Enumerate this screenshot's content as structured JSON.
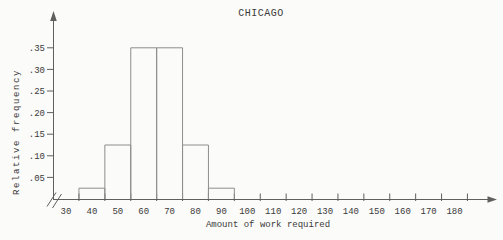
{
  "colors": {
    "background": "#fbfbf9",
    "axis": "#5f5f5f",
    "bar_outline": "#8d8d8d",
    "text": "#3a3a3a"
  },
  "chart_data": {
    "type": "bar",
    "title": "CHICAGO",
    "xlabel": "Amount of work required",
    "ylabel": "Relative frequency",
    "bars": [
      {
        "from": 35,
        "to": 45,
        "rel_freq": 0.025
      },
      {
        "from": 45,
        "to": 55,
        "rel_freq": 0.125
      },
      {
        "from": 55,
        "to": 65,
        "rel_freq": 0.35
      },
      {
        "from": 65,
        "to": 75,
        "rel_freq": 0.35
      },
      {
        "from": 75,
        "to": 85,
        "rel_freq": 0.125
      },
      {
        "from": 85,
        "to": 95,
        "rel_freq": 0.025
      }
    ],
    "x_tick_labels": [
      30,
      40,
      50,
      60,
      70,
      80,
      90,
      100,
      110,
      120,
      130,
      140,
      150,
      160,
      170,
      180
    ],
    "x_boundary_ticks": [
      35,
      45,
      55,
      65,
      75,
      85,
      95,
      105,
      115,
      125,
      135,
      145,
      155,
      165,
      175,
      185
    ],
    "y_ticks": [
      {
        "value": 0.05,
        "label": ".05"
      },
      {
        "value": 0.1,
        "label": ".10"
      },
      {
        "value": 0.15,
        "label": ".15"
      },
      {
        "value": 0.2,
        "label": ".20"
      },
      {
        "value": 0.25,
        "label": ".25"
      },
      {
        "value": 0.3,
        "label": ".30"
      },
      {
        "value": 0.35,
        "label": ".35"
      }
    ],
    "xlim": [
      30,
      190
    ],
    "ylim": [
      0,
      0.4
    ],
    "grid": false,
    "legend": false,
    "axis_break_at_origin": true,
    "x_axis_arrow": true,
    "y_axis_arrow": true
  }
}
